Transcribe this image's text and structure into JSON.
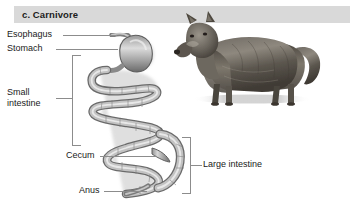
{
  "figure": {
    "header": {
      "title": "c. Carnivore",
      "band_color": "#d9d9d9",
      "text_color": "#1c1c1c"
    },
    "background_color": "#ffffff",
    "line_color": "#8c8c8c"
  },
  "labels": {
    "esophagus": "Esophagus",
    "stomach": "Stomach",
    "small_intestine": "Small intestine",
    "cecum": "Cecum",
    "anus": "Anus",
    "large_intestine": "Large intestine"
  },
  "illustration": {
    "digestive_tract_name": "carnivore-digestive-tract-diagram",
    "animal_name": "wolf-photograph",
    "organ_fill": "#b3b3b3",
    "organ_outline": "#4d4d4d",
    "organ_highlight": "#e6e6e6",
    "shadow_color": "#cccccc"
  },
  "brackets": {
    "small_intestine_side": "right",
    "large_intestine_side": "left"
  }
}
